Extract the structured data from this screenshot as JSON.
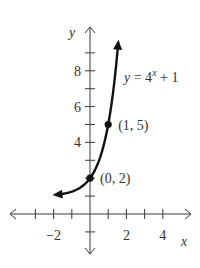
{
  "chart_data": {
    "type": "line",
    "title": "",
    "equation_label": "y = 4^x + 1",
    "equation_parts": {
      "lhs": "y = 4",
      "exp": "x",
      "rhs": " + 1"
    },
    "xlabel": "x",
    "ylabel": "y",
    "xlim": [
      -4.5,
      5.5
    ],
    "ylim": [
      -2.2,
      10.4
    ],
    "x_tick_labels": [
      {
        "value": -2,
        "label": "−2"
      },
      {
        "value": 2,
        "label": "2"
      },
      {
        "value": 4,
        "label": "4"
      }
    ],
    "y_tick_labels": [
      {
        "value": 4,
        "label": "4"
      },
      {
        "value": 6,
        "label": "6"
      },
      {
        "value": 8,
        "label": "8"
      }
    ],
    "x_ticks": [
      -3,
      -2,
      -1,
      1,
      2,
      3,
      4
    ],
    "y_ticks": [
      -1,
      1,
      2,
      3,
      4,
      5,
      6,
      7,
      8,
      9
    ],
    "series": [
      {
        "name": "y = 4^x + 1",
        "function": "4^x + 1",
        "x_range": [
          -1.9,
          1.55
        ],
        "x": [
          -1.9,
          -1.5,
          -1.0,
          -0.5,
          0,
          0.5,
          1.0,
          1.3,
          1.55
        ],
        "values": [
          1.07,
          1.13,
          1.25,
          1.5,
          2,
          3,
          5,
          7.06,
          9.58
        ]
      }
    ],
    "labeled_points": [
      {
        "x": 0,
        "y": 2,
        "label": "(0, 2)"
      },
      {
        "x": 1,
        "y": 5,
        "label": "(1, 5)"
      }
    ],
    "grid": false,
    "legend": "none"
  }
}
